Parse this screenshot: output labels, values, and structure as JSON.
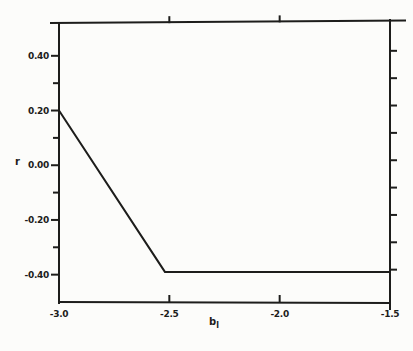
{
  "figure": {
    "background": "#fcfcfa",
    "ink": "#1d1d1b"
  },
  "chart_data": {
    "type": "line",
    "title": "",
    "xlabel": "b",
    "xlabel_sub": "l",
    "ylabel": "r",
    "xlim": [
      -3.0,
      -1.5
    ],
    "ylim": [
      -0.5,
      0.52
    ],
    "grid": false,
    "legend": false,
    "x_ticks": [
      {
        "value": -3.0,
        "label": "-3.0"
      },
      {
        "value": -2.5,
        "label": "-2.5"
      },
      {
        "value": -2.0,
        "label": "-2.0"
      },
      {
        "value": -1.5,
        "label": "-1.5"
      }
    ],
    "y_ticks_major": [
      {
        "value": 0.4,
        "label": "0.40"
      },
      {
        "value": 0.2,
        "label": "0.20"
      },
      {
        "value": 0.0,
        "label": "0.00"
      },
      {
        "value": -0.2,
        "label": "-0.20"
      },
      {
        "value": -0.4,
        "label": "-0.40"
      }
    ],
    "y_ticks_minor": [
      0.3,
      0.1,
      -0.1,
      -0.3
    ],
    "right_axis_ticks": [
      0.4,
      0.3,
      0.2,
      0.1,
      0.0,
      -0.1,
      -0.2,
      -0.3,
      -0.4
    ],
    "top_axis_ticks": [
      -2.5,
      -2.0
    ],
    "series": [
      {
        "name": "r",
        "color": "#1d1d1b",
        "points": [
          [
            -3.0,
            0.2
          ],
          [
            -2.52,
            -0.39
          ],
          [
            -1.5,
            -0.39
          ]
        ]
      }
    ]
  }
}
